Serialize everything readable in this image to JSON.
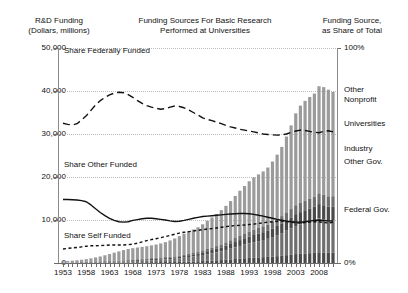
{
  "header": {
    "left_title": "R&D Funding",
    "left_subtitle": "(Dollars, millions)",
    "center_title_line1": "Funding Sources For Basic Research",
    "center_title_line2": "Performed at Universities",
    "right_title_line1": "Funding Source,",
    "right_title_line2": "as Share of Total"
  },
  "annotations": {
    "federal": "Share Federally Funded",
    "other": "Share Other Funded",
    "self": "Share Self Funded"
  },
  "right_labels": [
    {
      "name": "other-nonprofit-line1",
      "text": "Other"
    },
    {
      "name": "other-nonprofit-line2",
      "text": "Nonprofit"
    },
    {
      "name": "universities",
      "text": "Universities"
    },
    {
      "name": "industry",
      "text": "Industry"
    },
    {
      "name": "other-gov",
      "text": "Other Gov."
    },
    {
      "name": "federal-gov",
      "text": "Federal Gov."
    }
  ],
  "chart_data": {
    "type": "bar",
    "title": "Funding Sources For Basic Research Performed at Universities",
    "xlabel": "",
    "ylabel": "R&D Funding (Dollars, millions)",
    "y2label": "Funding Source, as Share of Total",
    "ylim": [
      0,
      50000
    ],
    "y2lim": [
      0,
      100
    ],
    "grid": true,
    "legend": "right-side-stack-labels",
    "yticks": [
      "0",
      "10,000",
      "20,000",
      "30,000",
      "40,000",
      "50,000"
    ],
    "ytick_values": [
      0,
      10000,
      20000,
      30000,
      40000,
      50000
    ],
    "y2ticks": [
      "0%",
      "100%"
    ],
    "y2tick_values": [
      0,
      100
    ],
    "xticks": [
      "1953",
      "1958",
      "1963",
      "1968",
      "1973",
      "1978",
      "1983",
      "1988",
      "1993",
      "1998",
      "2003",
      "2008"
    ],
    "x": [
      1953,
      1954,
      1955,
      1956,
      1957,
      1958,
      1959,
      1960,
      1961,
      1962,
      1963,
      1964,
      1965,
      1966,
      1967,
      1968,
      1969,
      1970,
      1971,
      1972,
      1973,
      1974,
      1975,
      1976,
      1977,
      1978,
      1979,
      1980,
      1981,
      1982,
      1983,
      1984,
      1985,
      1986,
      1987,
      1988,
      1989,
      1990,
      1991,
      1992,
      1993,
      1994,
      1995,
      1996,
      1997,
      1998,
      1999,
      2000,
      2001,
      2002,
      2003,
      2004,
      2005,
      2006,
      2007,
      2008,
      2009,
      2010,
      2011
    ],
    "bars": {
      "name": "Total R&D funding",
      "unit": "Dollars, millions",
      "values": [
        420,
        470,
        540,
        640,
        760,
        900,
        1080,
        1300,
        1520,
        1800,
        2080,
        2400,
        2700,
        3000,
        3250,
        3450,
        3600,
        3750,
        3900,
        4100,
        4300,
        4550,
        4850,
        5250,
        5700,
        6250,
        6800,
        7350,
        7800,
        8300,
        9000,
        9800,
        10600,
        11400,
        12300,
        13300,
        14400,
        15600,
        16800,
        17900,
        19000,
        19900,
        20600,
        21300,
        22200,
        23600,
        25200,
        27000,
        29400,
        32000,
        34800,
        36600,
        37700,
        38600,
        39400,
        41100,
        40900,
        40300,
        39800
      ],
      "segments": [
        {
          "name": "Federal Gov.",
          "color": "#9b9b9b"
        },
        {
          "name": "Other Gov.",
          "color": "#6f6f6f"
        },
        {
          "name": "Industry",
          "color": "#4a4a4a"
        },
        {
          "name": "Universities",
          "color": "#6f6f6f"
        },
        {
          "name": "Other Nonprofit",
          "color": "#4a4a4a"
        }
      ]
    },
    "series": [
      {
        "name": "Share Federally Funded",
        "style": "long-dashed",
        "axis": "right",
        "unit": "percent",
        "values": [
          65.0,
          64.5,
          64.2,
          64.8,
          66.5,
          68.5,
          71.0,
          73.5,
          75.5,
          77.0,
          78.2,
          79.0,
          79.4,
          79.2,
          78.3,
          77.0,
          75.5,
          74.2,
          73.2,
          72.5,
          72.0,
          71.5,
          71.8,
          72.5,
          73.0,
          72.8,
          72.2,
          71.2,
          70.0,
          68.8,
          67.5,
          66.8,
          66.2,
          65.5,
          64.8,
          64.0,
          63.3,
          62.8,
          62.2,
          61.8,
          61.4,
          61.0,
          60.5,
          60.0,
          59.8,
          59.6,
          59.5,
          59.6,
          60.0,
          60.8,
          61.4,
          61.8,
          61.6,
          61.2,
          60.8,
          60.6,
          61.2,
          61.5,
          61.0
        ]
      },
      {
        "name": "Share Other Funded",
        "style": "solid",
        "axis": "right",
        "unit": "percent",
        "values": [
          29.5,
          29.5,
          29.4,
          29.3,
          29.0,
          28.5,
          27.0,
          25.2,
          23.5,
          22.0,
          20.8,
          19.8,
          19.2,
          19.0,
          19.2,
          19.8,
          20.2,
          20.6,
          20.8,
          20.8,
          20.6,
          20.3,
          20.0,
          19.6,
          19.3,
          19.4,
          19.8,
          20.3,
          20.8,
          21.2,
          21.6,
          21.8,
          22.0,
          22.2,
          22.4,
          22.6,
          22.8,
          22.9,
          23.0,
          23.0,
          22.9,
          22.6,
          22.2,
          21.8,
          21.3,
          20.8,
          20.3,
          19.9,
          19.5,
          19.2,
          19.0,
          19.0,
          19.2,
          19.5,
          19.8,
          20.0,
          19.8,
          19.6,
          19.5
        ]
      },
      {
        "name": "Share Self Funded",
        "style": "short-dashed",
        "axis": "right",
        "unit": "percent",
        "values": [
          6.5,
          6.8,
          7.0,
          7.2,
          7.5,
          7.8,
          8.0,
          8.0,
          8.1,
          8.2,
          8.4,
          8.4,
          8.4,
          8.4,
          8.5,
          8.8,
          9.2,
          9.8,
          10.4,
          10.9,
          11.3,
          11.8,
          12.3,
          12.8,
          13.4,
          13.9,
          14.3,
          14.6,
          14.9,
          15.2,
          15.5,
          15.8,
          16.0,
          16.3,
          16.6,
          16.9,
          17.2,
          17.4,
          17.5,
          17.7,
          17.9,
          18.1,
          18.4,
          18.7,
          19.0,
          19.2,
          19.4,
          19.5,
          19.3,
          19.0,
          18.7,
          18.6,
          18.8,
          19.0,
          19.2,
          19.2,
          18.8,
          18.6,
          18.9
        ]
      }
    ]
  }
}
